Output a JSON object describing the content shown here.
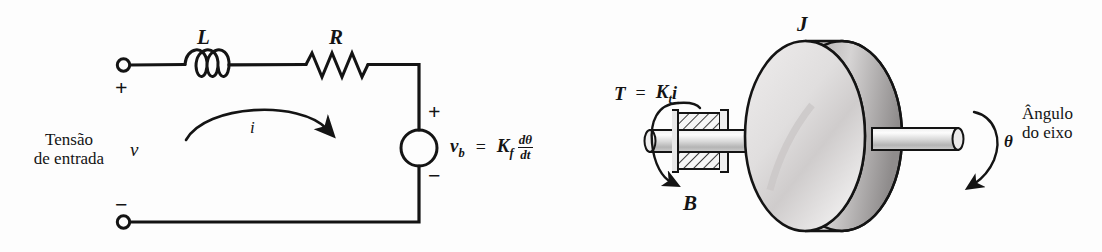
{
  "figure": {
    "background_color": "#fdfdfd",
    "ink_color": "#141414"
  },
  "circuit": {
    "input_label_line1": "Tensão",
    "input_label_line2": "de entrada",
    "input_voltage_symbol": "v",
    "inductor_label": "L",
    "resistor_label": "R",
    "current_label": "i",
    "terminal_plus": "+",
    "terminal_minus": "−",
    "source_plus": "+",
    "source_minus": "−",
    "back_emf_symbol": "v",
    "back_emf_subscript": "b",
    "equals": "=",
    "gain_symbol": "K",
    "gain_subscript": "f",
    "derivative_numerator": "dθ",
    "derivative_denominator": "dt"
  },
  "mechanical": {
    "torque_symbol": "T",
    "torque_equals": "=",
    "torque_gain": "K",
    "torque_gain_subscript": "t",
    "torque_current": "i",
    "damping_label": "B",
    "inertia_label": "J",
    "angle_symbol": "θ",
    "angle_label_line1": "Ângulo",
    "angle_label_line2": "do eixo"
  }
}
